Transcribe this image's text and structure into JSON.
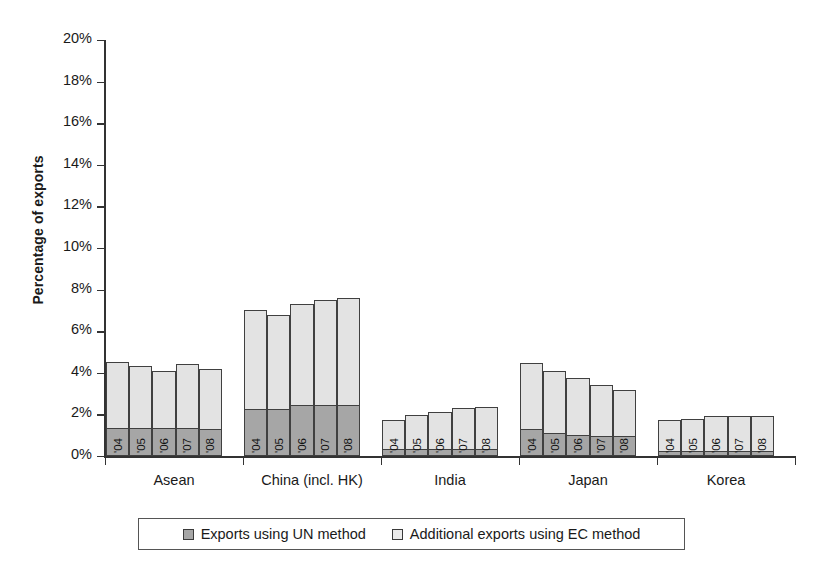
{
  "chart_data": {
    "type": "bar",
    "subtype": "stacked-grouped-column",
    "title": "",
    "subtitle": "",
    "xlabel": "",
    "ylabel": "Percentage of exports",
    "ylim": [
      0,
      20
    ],
    "ytick_step": 2,
    "ytick_labels": [
      "0%",
      "2%",
      "4%",
      "6%",
      "8%",
      "10%",
      "12%",
      "14%",
      "16%",
      "18%",
      "20%"
    ],
    "ytick_values": [
      0,
      2,
      4,
      6,
      8,
      10,
      12,
      14,
      16,
      18,
      20
    ],
    "grid": false,
    "legend_position": "bottom",
    "categories": [
      "Asean",
      "China (incl. HK)",
      "India",
      "Japan",
      "Korea"
    ],
    "subcategories": [
      "'04",
      "'05",
      "'06",
      "'07",
      "'08"
    ],
    "series": [
      {
        "name": "Exports using UN method",
        "color": "#a6a6a6",
        "values": [
          [
            1.35,
            1.35,
            1.35,
            1.35,
            1.3
          ],
          [
            2.25,
            2.25,
            2.45,
            2.45,
            2.45
          ],
          [
            0.35,
            0.35,
            0.35,
            0.35,
            0.35
          ],
          [
            1.3,
            1.1,
            1.0,
            0.95,
            0.95
          ],
          [
            0.25,
            0.25,
            0.25,
            0.25,
            0.25
          ]
        ]
      },
      {
        "name": "Additional exports using EC method",
        "color": "#e3e3e3",
        "values": [
          [
            3.15,
            3.0,
            2.75,
            3.05,
            2.9
          ],
          [
            4.75,
            4.55,
            4.85,
            5.05,
            5.15
          ],
          [
            1.4,
            1.6,
            1.75,
            1.95,
            2.0
          ],
          [
            3.15,
            3.0,
            2.75,
            2.45,
            2.2
          ],
          [
            1.5,
            1.55,
            1.65,
            1.65,
            1.65
          ]
        ]
      }
    ],
    "totals": [
      [
        4.5,
        4.35,
        4.1,
        4.4,
        4.2
      ],
      [
        7.0,
        6.8,
        7.3,
        7.5,
        7.6
      ],
      [
        1.75,
        1.95,
        2.1,
        2.3,
        2.35
      ],
      [
        4.45,
        4.1,
        3.75,
        3.4,
        3.15
      ],
      [
        1.75,
        1.8,
        1.9,
        1.9,
        1.9
      ]
    ],
    "units": "percent"
  },
  "legend": {
    "items": [
      {
        "label": "Exports using UN method",
        "swatch": "un"
      },
      {
        "label": "Additional exports using EC method",
        "swatch": "ec"
      }
    ]
  }
}
